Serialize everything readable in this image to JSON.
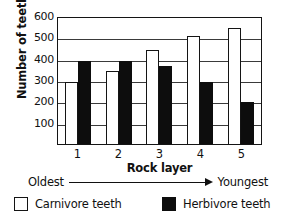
{
  "chart_data": {
    "type": "bar",
    "title": "",
    "xlabel": "Rock layer",
    "ylabel": "Number of teeth",
    "categories": [
      "1",
      "2",
      "3",
      "4",
      "5"
    ],
    "series": [
      {
        "name": "Carnivore teeth",
        "values": [
          300,
          350,
          450,
          520,
          560
        ],
        "color": "#ffffff"
      },
      {
        "name": "Herbivore teeth",
        "values": [
          400,
          400,
          375,
          300,
          200
        ],
        "color": "#0d0d0d"
      }
    ],
    "ylim": [
      0,
      600
    ],
    "yticks": [
      100,
      200,
      300,
      400,
      500,
      600
    ],
    "ytick_labels": [
      "100",
      "200",
      "300",
      "400",
      "500",
      "600"
    ],
    "grid": true,
    "legend_position": "bottom",
    "annotations": {
      "axis_direction_left": "Oldest",
      "axis_direction_right": "Youngest",
      "arrow": "right-arrow"
    }
  },
  "legend": {
    "items": [
      {
        "label": "Carnivore teeth",
        "swatch": "open-square-icon"
      },
      {
        "label": "Herbivore teeth",
        "swatch": "filled-square-icon"
      }
    ]
  }
}
